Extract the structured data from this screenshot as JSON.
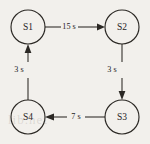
{
  "figure": {
    "background_color": "#f2f0ec",
    "ink_color": "#2b2824",
    "watermark_text": "lib.net"
  },
  "diagram_data": {
    "type": "state-transition-diagram",
    "nodes": [
      {
        "id": "S1",
        "label": "S1",
        "cx": 28,
        "cy": 27,
        "r": 17
      },
      {
        "id": "S2",
        "label": "S2",
        "cx": 122,
        "cy": 27,
        "r": 17
      },
      {
        "id": "S3",
        "label": "S3",
        "cx": 122,
        "cy": 117,
        "r": 17
      },
      {
        "id": "S4",
        "label": "S4",
        "cx": 28,
        "cy": 117,
        "r": 17
      }
    ],
    "edges": [
      {
        "from": "S1",
        "to": "S2",
        "label": "15 s",
        "label_x": 69,
        "label_y": 27,
        "direction": "right"
      },
      {
        "from": "S2",
        "to": "S3",
        "label": "3 s",
        "label_x": 112,
        "label_y": 70,
        "direction": "down"
      },
      {
        "from": "S3",
        "to": "S4",
        "label": "7 s",
        "label_x": 76,
        "label_y": 117,
        "direction": "left"
      },
      {
        "from": "S4",
        "to": "S1",
        "label": "3 s",
        "label_x": 19,
        "label_y": 70,
        "direction": "up"
      }
    ]
  }
}
